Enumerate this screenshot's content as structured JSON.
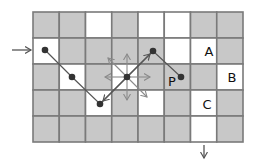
{
  "diagram": {
    "grid": {
      "cols": 8,
      "rows": 5,
      "origin": [
        33,
        12
      ],
      "cell_size": 26.25,
      "cell_height": 26,
      "colors": {
        "gray": "#c8c8c8",
        "white": "#ffffff",
        "border": "#7a7a7a"
      },
      "cells": [
        [
          "G",
          "G",
          "W",
          "G",
          "W",
          "W",
          "G",
          "G"
        ],
        [
          "W",
          "G",
          "G",
          "G",
          "G",
          "W",
          "W",
          "G"
        ],
        [
          "G",
          "W",
          "G",
          "W",
          "G",
          "G",
          "G",
          "W"
        ],
        [
          "G",
          "G",
          "W",
          "G",
          "W",
          "G",
          "W",
          "G"
        ],
        [
          "G",
          "G",
          "G",
          "G",
          "G",
          "G",
          "W",
          "G"
        ]
      ]
    },
    "labels": [
      {
        "text": "A",
        "x": 209,
        "y": 56
      },
      {
        "text": "B",
        "x": 232,
        "y": 82
      },
      {
        "text": "C",
        "x": 207,
        "y": 109
      },
      {
        "text": "P",
        "x": 172,
        "y": 86
      }
    ],
    "path_points": [
      {
        "x": 45,
        "y": 50
      },
      {
        "x": 72,
        "y": 77
      },
      {
        "x": 100,
        "y": 104
      },
      {
        "x": 127,
        "y": 77
      },
      {
        "x": 153,
        "y": 51
      },
      {
        "x": 181,
        "y": 77
      }
    ],
    "dots": [
      {
        "x": 45,
        "y": 50
      },
      {
        "x": 72,
        "y": 77
      },
      {
        "x": 100,
        "y": 104
      },
      {
        "x": 127,
        "y": 77
      },
      {
        "x": 153,
        "y": 51
      },
      {
        "x": 181,
        "y": 77
      }
    ],
    "center_arrows": {
      "origin": {
        "x": 127,
        "y": 77
      },
      "targets": [
        {
          "dir": "up",
          "x": 127,
          "y": 54
        },
        {
          "dir": "down",
          "x": 127,
          "y": 100
        },
        {
          "dir": "left",
          "x": 105,
          "y": 77
        },
        {
          "dir": "right",
          "x": 150,
          "y": 77
        },
        {
          "dir": "up-left",
          "x": 108,
          "y": 58
        },
        {
          "dir": "down-right",
          "x": 147,
          "y": 97
        }
      ],
      "color": "#8a8a8a"
    },
    "path_arrows": [
      {
        "dir": "up-right",
        "from": {
          "x": 127,
          "y": 77
        },
        "to": {
          "x": 150,
          "y": 54
        }
      },
      {
        "dir": "down-left",
        "from": {
          "x": 127,
          "y": 77
        },
        "to": {
          "x": 103,
          "y": 101
        }
      }
    ],
    "entry_arrow": {
      "from": {
        "x": 12,
        "y": 50
      },
      "to": {
        "x": 31,
        "y": 50
      }
    },
    "exit_arrow": {
      "from": {
        "x": 204,
        "y": 145
      },
      "to": {
        "x": 204,
        "y": 158
      }
    },
    "line_color": "#555555",
    "dot_color": "#333333"
  }
}
